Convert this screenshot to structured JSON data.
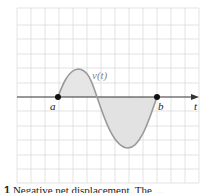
{
  "figure": {
    "type": "diagram",
    "function_label": "v(t)",
    "axis_label": "t",
    "points": [
      {
        "label": "a"
      },
      {
        "label": "b"
      }
    ],
    "colors": {
      "grid": "#dcdcdc",
      "axis": "#333333",
      "curve": "#9a9a9a",
      "fill": "#e4e4e4",
      "dot": "#111111"
    }
  },
  "caption": {
    "number": "1",
    "text": "Negative net displacement. The ..."
  }
}
